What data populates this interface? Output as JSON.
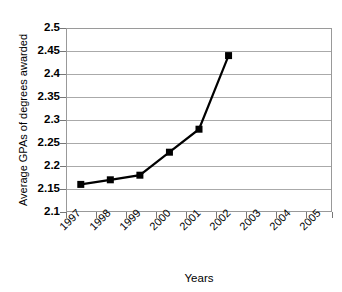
{
  "chart_data": {
    "type": "line",
    "title": "",
    "xlabel": "Years",
    "ylabel": "Average GPAs of degrees awarded",
    "x": [
      1997,
      1998,
      1999,
      2000,
      2001,
      2002
    ],
    "values": [
      2.16,
      2.17,
      2.18,
      2.23,
      2.28,
      2.44
    ],
    "series": [
      {
        "name": "Average GPAs of degrees awarded",
        "values": [
          2.16,
          2.17,
          2.18,
          2.23,
          2.28,
          2.44
        ]
      }
    ],
    "x_tick_labels": [
      "1997",
      "1998",
      "1999",
      "2000",
      "2001",
      "2002",
      "2003",
      "2004",
      "2005"
    ],
    "y_tick_labels": [
      "2.5",
      "2.45",
      "2.4",
      "2.35",
      "2.3",
      "2.25",
      "2.2",
      "2.15",
      "2.1"
    ],
    "y_ticks": [
      2.5,
      2.45,
      2.4,
      2.35,
      2.3,
      2.25,
      2.2,
      2.15,
      2.1
    ],
    "ylim": [
      2.1,
      2.5
    ],
    "xlim": [
      1996.5,
      2005.5
    ],
    "grid": true,
    "legend": false,
    "marker": "square",
    "marker_color": "#000000",
    "line_color": "#000000",
    "grid_color": "#aaaaaa",
    "plot_border_color": "#999999",
    "background": "#ffffff"
  },
  "axes": {
    "x_title": "Years",
    "y_title": "Average GPAs of degrees awarded"
  }
}
